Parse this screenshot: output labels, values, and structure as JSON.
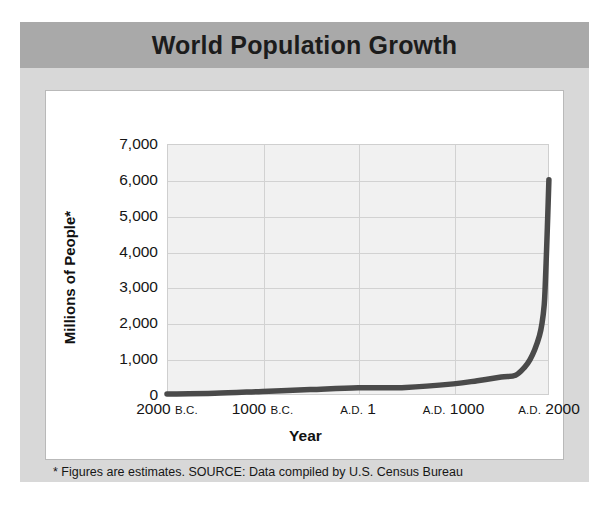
{
  "title": "World Population Growth",
  "footnote": "* Figures are estimates. SOURCE: Data compiled by U.S. Census Bureau",
  "chart_data": {
    "type": "line",
    "title": "World Population Growth",
    "xlabel": "Year",
    "ylabel": "Millions of People*",
    "ylim": [
      0,
      7000
    ],
    "xlim": [
      -2000,
      2000
    ],
    "grid": true,
    "legend": "none",
    "line_color": "#4a4a4a",
    "plot_bg": "#f1f1f1",
    "grid_color": "#d2d2d2",
    "yticks": [
      "0",
      "1,000",
      "2,000",
      "3,000",
      "4,000",
      "5,000",
      "6,000",
      "7,000"
    ],
    "ytick_values": [
      0,
      1000,
      2000,
      3000,
      4000,
      5000,
      6000,
      7000
    ],
    "xticks": [
      {
        "num": "2000",
        "era": "B.C.",
        "value": -2000
      },
      {
        "num": "1000",
        "era": "B.C.",
        "value": -1000
      },
      {
        "num": "1",
        "era": "A.D.",
        "era_first": true,
        "value": 1
      },
      {
        "num": "1000",
        "era": "A.D.",
        "era_first": true,
        "value": 1000
      },
      {
        "num": "2000",
        "era": "A.D.",
        "era_first": true,
        "value": 2000
      }
    ],
    "x": [
      -2000,
      -1500,
      -1000,
      -500,
      1,
      500,
      1000,
      1250,
      1500,
      1650,
      1750,
      1800,
      1850,
      1900,
      1927,
      1950,
      1960,
      1974,
      1987,
      1999
    ],
    "values": [
      27,
      50,
      100,
      150,
      200,
      210,
      310,
      400,
      500,
      550,
      790,
      980,
      1260,
      1650,
      2000,
      2520,
      3020,
      4000,
      5000,
      6000
    ],
    "annotations": [
      "* Figures are estimates. SOURCE: Data compiled by U.S. Census Bureau"
    ]
  },
  "colors": {
    "title_band": "#a9a9a9",
    "panel": "#d8d8d8",
    "card": "#ffffff",
    "line": "#4a4a4a"
  }
}
